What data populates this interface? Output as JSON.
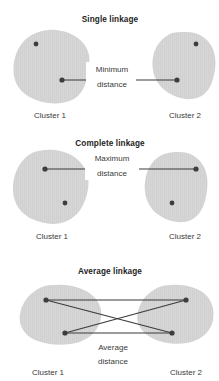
{
  "figure": {
    "background_color": "#ffffff",
    "blob_color": "#d6d6d6",
    "point_color": "#3d3d3d",
    "line_color": "#3a3a3a",
    "text_color": "#3a3a3a"
  },
  "panels": [
    {
      "id": "single-linkage",
      "title": "Single linkage",
      "distance_label_line1": "Minimum",
      "distance_label_line2": "distance",
      "left_cluster_label": "Cluster 1",
      "right_cluster_label": "Cluster 2",
      "connection_description": "Line joins the two closest points, one in each cluster",
      "points": [
        {
          "name": "left-outlier-point",
          "x": 36,
          "y": 44
        },
        {
          "name": "left-nearest-point",
          "x": 62,
          "y": 80
        },
        {
          "name": "right-nearest-point",
          "x": 177,
          "y": 80
        },
        {
          "name": "right-outlier-point",
          "x": 196,
          "y": 44
        }
      ],
      "lines": [
        {
          "name": "minimum-distance-line",
          "x1": 62,
          "y1": 80,
          "x2": 177,
          "y2": 80
        }
      ]
    },
    {
      "id": "complete-linkage",
      "title": "Complete linkage",
      "distance_label_line1": "Maximum",
      "distance_label_line2": "distance",
      "left_cluster_label": "Cluster 1",
      "right_cluster_label": "Cluster 2",
      "connection_description": "Line joins the two farthest points, one in each cluster",
      "points": [
        {
          "name": "left-farthest-point",
          "x": 45,
          "y": 169
        },
        {
          "name": "left-inner-point",
          "x": 65,
          "y": 203
        },
        {
          "name": "right-farthest-point",
          "x": 196,
          "y": 169
        },
        {
          "name": "right-inner-point",
          "x": 172,
          "y": 203
        }
      ],
      "lines": [
        {
          "name": "maximum-distance-line",
          "x1": 45,
          "y1": 169,
          "x2": 196,
          "y2": 169
        }
      ]
    },
    {
      "id": "average-linkage",
      "title": "Average linkage",
      "distance_label_line1": "Average",
      "distance_label_line2": "distance",
      "left_cluster_label": "Cluster 1",
      "right_cluster_label": "Cluster 2",
      "connection_description": "All four pairwise links between points of the two clusters are drawn and averaged",
      "points": [
        {
          "name": "left-top-point",
          "x": 46,
          "y": 300
        },
        {
          "name": "left-bottom-point",
          "x": 65,
          "y": 333
        },
        {
          "name": "right-top-point",
          "x": 186,
          "y": 300
        },
        {
          "name": "right-bottom-point",
          "x": 172,
          "y": 333
        }
      ],
      "lines": [
        {
          "name": "top-horizontal-link",
          "x1": 46,
          "y1": 300,
          "x2": 186,
          "y2": 300
        },
        {
          "name": "bottom-horizontal-link",
          "x1": 65,
          "y1": 333,
          "x2": 172,
          "y2": 333
        },
        {
          "name": "diagonal-link-down",
          "x1": 46,
          "y1": 300,
          "x2": 172,
          "y2": 333
        },
        {
          "name": "diagonal-link-up",
          "x1": 65,
          "y1": 333,
          "x2": 186,
          "y2": 300
        }
      ]
    }
  ]
}
